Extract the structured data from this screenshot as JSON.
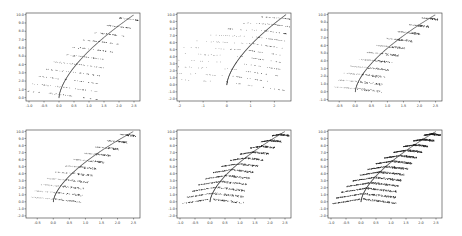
{
  "chart_data": [
    {
      "type": "scatter",
      "panel": "top-left",
      "title": "",
      "xlabel": "",
      "ylabel": "",
      "xticks": [
        "-1.0",
        "-0.5",
        "0.0",
        "0.5",
        "1.0",
        "1.5",
        "2.0",
        "2.5"
      ],
      "yticks": [
        "0.0",
        "1.0",
        "2.0",
        "3.0",
        "4.0",
        "5.0",
        "6.0",
        "7.0",
        "8.0",
        "9.0",
        "10.0"
      ],
      "xlim": [
        -1.1,
        2.7
      ],
      "ylim": [
        -0.4,
        10.2
      ],
      "grid": false,
      "description": "Fern-like curve: spine from (0,0) curving to (2.5,10); 11 leaf strokes branching left/right at each integer level",
      "levels": 11,
      "density": "sparse",
      "spread": 1.0
    },
    {
      "type": "scatter",
      "panel": "top-center",
      "title": "",
      "xlabel": "",
      "ylabel": "",
      "xticks": [
        "-2",
        "-1",
        "0",
        "1",
        "2"
      ],
      "yticks": [
        "-2.0",
        "-1.0",
        "0.0",
        "1.0",
        "2.0",
        "3.0",
        "4.0",
        "5.0",
        "6.0",
        "7.0",
        "8.0",
        "9.0",
        "10.0"
      ],
      "xlim": [
        -2.1,
        2.7
      ],
      "ylim": [
        -2.3,
        10.2
      ],
      "grid": false,
      "description": "Fern curve with long straight leaf strokes extending far left (to x≈-2) and short right hooks",
      "levels": 11,
      "density": "sparse",
      "spread": 2.0
    },
    {
      "type": "scatter",
      "panel": "top-right",
      "title": "",
      "xlabel": "",
      "ylabel": "",
      "xticks": [
        "-0.5",
        "0.0",
        "0.5",
        "1.0",
        "1.5",
        "2.0",
        "2.5"
      ],
      "yticks": [
        "-1.0",
        "0.0",
        "1.0",
        "2.0",
        "3.0",
        "4.0",
        "5.0",
        "6.0",
        "7.0",
        "8.0",
        "9.0",
        "10.0"
      ],
      "xlim": [
        -0.85,
        2.7
      ],
      "ylim": [
        -1.2,
        10.2
      ],
      "grid": false,
      "description": "Fern curve with dense clustered leaf strokes to the right, faint short strokes to the left",
      "levels": 11,
      "density": "medium",
      "spread": 0.55
    },
    {
      "type": "scatter",
      "panel": "bottom-left",
      "title": "",
      "xlabel": "",
      "ylabel": "",
      "xticks": [
        "-0.5",
        "0.0",
        "0.5",
        "1.0",
        "1.5",
        "2.0",
        "2.5"
      ],
      "yticks": [
        "-2.0",
        "-1.0",
        "0.0",
        "1.0",
        "2.0",
        "3.0",
        "4.0",
        "5.0",
        "6.0",
        "7.0",
        "8.0",
        "9.0",
        "10.0"
      ],
      "xlim": [
        -0.85,
        2.7
      ],
      "ylim": [
        -2.3,
        10.2
      ],
      "grid": false,
      "description": "Fern curve with denser rightward leaf clusters",
      "levels": 11,
      "density": "medium",
      "spread": 0.6
    },
    {
      "type": "scatter",
      "panel": "bottom-center",
      "title": "",
      "xlabel": "",
      "ylabel": "",
      "xticks": [
        "-1.0",
        "-0.5",
        "0.0",
        "0.5",
        "1.0",
        "1.5",
        "2.0",
        "2.5"
      ],
      "yticks": [
        "-2.0",
        "-1.0",
        "0.0",
        "1.0",
        "2.0",
        "3.0",
        "4.0",
        "5.0",
        "6.0",
        "7.0",
        "8.0",
        "9.0",
        "10.0"
      ],
      "xlim": [
        -1.1,
        2.7
      ],
      "ylim": [
        -2.3,
        10.2
      ],
      "grid": false,
      "description": "Fern curve with arched leaf bands sweeping from left (x≈-0.8) to right",
      "levels": 12,
      "density": "dense",
      "spread": 0.8
    },
    {
      "type": "scatter",
      "panel": "bottom-right",
      "title": "",
      "xlabel": "",
      "ylabel": "",
      "xticks": [
        "-1.0",
        "-0.5",
        "0.0",
        "0.5",
        "1.0",
        "1.5",
        "2.0",
        "2.5"
      ],
      "yticks": [
        "-2.0",
        "-1.0",
        "0.0",
        "1.0",
        "2.0",
        "3.0",
        "4.0",
        "5.0",
        "6.0",
        "7.0",
        "8.0",
        "9.0",
        "10.0"
      ],
      "xlim": [
        -1.1,
        2.7
      ],
      "ylim": [
        -2.3,
        10.2
      ],
      "grid": false,
      "description": "Very dense fern: many overlapping arched leaf bands",
      "levels": 13,
      "density": "very-dense",
      "spread": 0.85
    }
  ],
  "layout": {
    "panels": [
      {
        "x": 26,
        "y": 13,
        "w": 114,
        "h": 88
      },
      {
        "x": 177,
        "y": 13,
        "w": 114,
        "h": 88
      },
      {
        "x": 328,
        "y": 13,
        "w": 114,
        "h": 88
      },
      {
        "x": 26,
        "y": 130,
        "w": 114,
        "h": 88
      },
      {
        "x": 177,
        "y": 130,
        "w": 114,
        "h": 88
      },
      {
        "x": 328,
        "y": 130,
        "w": 114,
        "h": 88
      }
    ],
    "colors": {
      "marker": "#1a1a1a",
      "frame": "#333333",
      "background": "#ffffff"
    }
  }
}
